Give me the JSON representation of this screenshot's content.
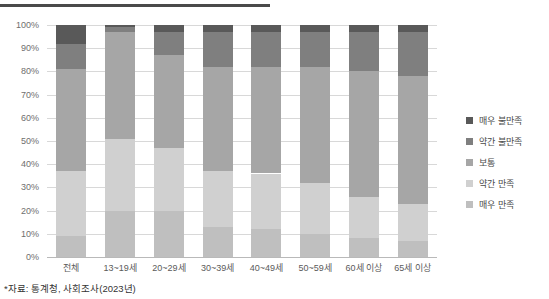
{
  "footnote": "*자료: 통계청, 사회조사(2023년)",
  "legend": {
    "position": "right",
    "items": [
      {
        "label": "매우 불만족",
        "color": "#595959"
      },
      {
        "label": "약간 불만족",
        "color": "#7f7f7f"
      },
      {
        "label": "보통",
        "color": "#a6a6a6"
      },
      {
        "label": "약간 만족",
        "color": "#d0d0d0"
      },
      {
        "label": "매우 만족",
        "color": "#bfbfbf"
      }
    ]
  },
  "axis": {
    "y_ticks": [
      "100%",
      "90%",
      "80%",
      "70%",
      "60%",
      "50%",
      "40%",
      "30%",
      "20%",
      "10%",
      "0%"
    ],
    "x_labels": [
      "전체",
      "13~19세",
      "20~29세",
      "30~39세",
      "40~49세",
      "50~59세",
      "60세 이상",
      "65세 이상"
    ]
  },
  "chart_data": {
    "type": "bar",
    "title": "",
    "subtitle": "",
    "xlabel": "",
    "ylabel": "",
    "stacked": true,
    "stack_total": 100,
    "ylim": [
      0,
      100
    ],
    "grid": true,
    "legend_position": "right",
    "categories": [
      "전체",
      "13~19세",
      "20~29세",
      "30~39세",
      "40~49세",
      "50~59세",
      "60세 이상",
      "65세 이상"
    ],
    "series": [
      {
        "name": "매우 만족",
        "color": "#bfbfbf",
        "values": [
          9,
          20,
          20,
          13,
          12,
          10,
          8,
          7
        ]
      },
      {
        "name": "약간 만족",
        "color": "#d0d0d0",
        "values": [
          28,
          31,
          27,
          24,
          24,
          22,
          18,
          16
        ]
      },
      {
        "name": "보통",
        "color": "#a6a6a6",
        "values": [
          44,
          46,
          40,
          45,
          46,
          50,
          54,
          55
        ]
      },
      {
        "name": "약간 불만족",
        "color": "#7f7f7f",
        "values": [
          11,
          2,
          10,
          15,
          15,
          15,
          17,
          19
        ]
      },
      {
        "name": "매우 불만족",
        "color": "#595959",
        "values": [
          8,
          1,
          3,
          3,
          3,
          3,
          3,
          3
        ]
      }
    ]
  }
}
